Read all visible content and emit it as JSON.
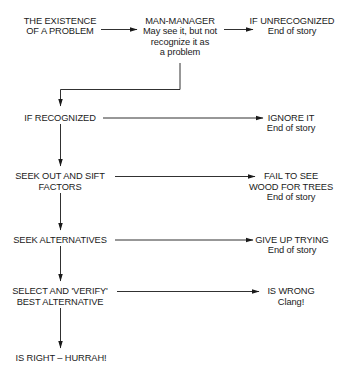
{
  "diagram": {
    "type": "flowchart",
    "nodes": {
      "existence": {
        "lines": [
          "THE EXISTENCE",
          "OF A PROBLEM"
        ]
      },
      "man_manager": {
        "lines": [
          "MAN-MANAGER",
          "May see it, but not",
          "recognize it as",
          "a problem"
        ]
      },
      "unrecognized": {
        "lines": [
          "IF UNRECOGNIZED",
          "End of story"
        ]
      },
      "recognized": {
        "lines": [
          "IF RECOGNIZED"
        ]
      },
      "ignore": {
        "lines": [
          "IGNORE IT",
          "End of story"
        ]
      },
      "seek_factors": {
        "lines": [
          "SEEK OUT AND SIFT",
          "FACTORS"
        ]
      },
      "fail_see": {
        "lines": [
          "FAIL TO SEE",
          "WOOD FOR TREES",
          "End of story"
        ]
      },
      "seek_alternatives": {
        "lines": [
          "SEEK ALTERNATIVES"
        ]
      },
      "give_up": {
        "lines": [
          "GIVE UP TRYING",
          "End of story"
        ]
      },
      "select_verify": {
        "lines": [
          "SELECT AND 'VERIFY'",
          "BEST ALTERNATIVE"
        ]
      },
      "is_wrong": {
        "lines": [
          "IS WRONG",
          "Clang!"
        ]
      },
      "is_right": {
        "lines": [
          "IS RIGHT – HURRAH!"
        ]
      }
    },
    "edges": [
      {
        "from": "existence",
        "to": "man_manager"
      },
      {
        "from": "man_manager",
        "to": "unrecognized"
      },
      {
        "from": "man_manager",
        "to": "recognized"
      },
      {
        "from": "recognized",
        "to": "ignore"
      },
      {
        "from": "recognized",
        "to": "seek_factors"
      },
      {
        "from": "seek_factors",
        "to": "fail_see"
      },
      {
        "from": "seek_factors",
        "to": "seek_alternatives"
      },
      {
        "from": "seek_alternatives",
        "to": "give_up"
      },
      {
        "from": "seek_alternatives",
        "to": "select_verify"
      },
      {
        "from": "select_verify",
        "to": "is_wrong"
      },
      {
        "from": "select_verify",
        "to": "is_right"
      }
    ],
    "colors": {
      "ink": "#1a1a1a",
      "background": "#ffffff"
    }
  }
}
